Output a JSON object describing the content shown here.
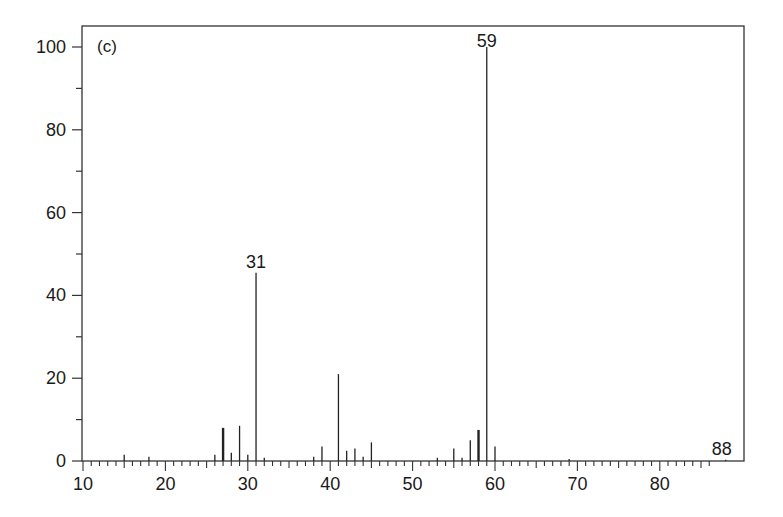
{
  "chart_data": {
    "type": "bar",
    "subtype": "mass-spectrum-stick",
    "panel_label": "(c)",
    "title": "",
    "xlabel": "",
    "ylabel": "",
    "xlim": [
      10,
      89
    ],
    "ylim": [
      0,
      104
    ],
    "x_ticks": [
      10,
      20,
      30,
      40,
      50,
      60,
      70,
      80
    ],
    "y_ticks": [
      0,
      20,
      40,
      60,
      80,
      100
    ],
    "x_minor_step": 1,
    "y_minor_step": 10,
    "grid": false,
    "legend": null,
    "peaks": [
      {
        "mz": 15,
        "intensity": 1.5
      },
      {
        "mz": 18,
        "intensity": 1.0
      },
      {
        "mz": 26,
        "intensity": 1.5
      },
      {
        "mz": 27,
        "intensity": 8.0
      },
      {
        "mz": 28,
        "intensity": 2.0
      },
      {
        "mz": 29,
        "intensity": 8.5
      },
      {
        "mz": 30,
        "intensity": 1.5
      },
      {
        "mz": 31,
        "intensity": 45.5
      },
      {
        "mz": 32,
        "intensity": 0.8
      },
      {
        "mz": 38,
        "intensity": 1.0
      },
      {
        "mz": 39,
        "intensity": 3.5
      },
      {
        "mz": 41,
        "intensity": 21.0
      },
      {
        "mz": 42,
        "intensity": 2.5
      },
      {
        "mz": 43,
        "intensity": 3.0
      },
      {
        "mz": 44,
        "intensity": 1.0
      },
      {
        "mz": 45,
        "intensity": 4.5
      },
      {
        "mz": 53,
        "intensity": 0.8
      },
      {
        "mz": 55,
        "intensity": 3.0
      },
      {
        "mz": 56,
        "intensity": 0.8
      },
      {
        "mz": 57,
        "intensity": 5.0
      },
      {
        "mz": 58,
        "intensity": 7.5
      },
      {
        "mz": 59,
        "intensity": 100.0
      },
      {
        "mz": 60,
        "intensity": 3.5
      },
      {
        "mz": 69,
        "intensity": 0.5
      },
      {
        "mz": 88,
        "intensity": 0.3
      }
    ],
    "annotations": [
      {
        "text": "31",
        "mz": 31
      },
      {
        "text": "59",
        "mz": 59
      },
      {
        "text": "88",
        "mz": 88
      }
    ],
    "heavy_peaks": [
      27,
      58
    ]
  }
}
